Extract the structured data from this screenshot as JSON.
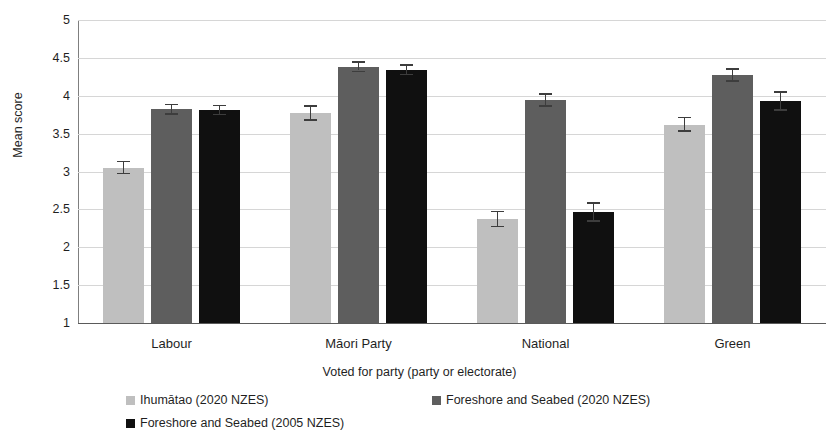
{
  "chart_data": {
    "type": "bar",
    "title": "",
    "xlabel": "Voted for party (party or electorate)",
    "ylabel": "Mean score",
    "ylim": [
      1,
      5
    ],
    "ytick_step": 0.5,
    "yticks": [
      "5",
      "4.5",
      "4",
      "3.5",
      "3",
      "2.5",
      "2",
      "1.5",
      "1"
    ],
    "ytick_values": [
      5,
      4.5,
      4,
      3.5,
      3,
      2.5,
      2,
      1.5,
      1
    ],
    "grid": true,
    "legend_position": "bottom",
    "error_bars": "standard error",
    "categories": [
      "Labour",
      "Māori Party",
      "National",
      "Green"
    ],
    "series": [
      {
        "name": "Ihumātao (2020 NZES)",
        "color": "#bfbfbf",
        "values": [
          3.05,
          3.77,
          2.37,
          3.62
        ],
        "errors": [
          0.08,
          0.09,
          0.1,
          0.09
        ]
      },
      {
        "name": "Foreshore and Seabed (2020 NZES)",
        "color": "#5e5e5e",
        "values": [
          3.82,
          4.38,
          3.94,
          4.27
        ],
        "errors": [
          0.06,
          0.06,
          0.08,
          0.08
        ]
      },
      {
        "name": "Foreshore and Seabed (2005 NZES)",
        "color": "#101010",
        "values": [
          3.81,
          4.34,
          2.46,
          3.93
        ],
        "errors": [
          0.06,
          0.06,
          0.12,
          0.12
        ]
      }
    ]
  },
  "legend": {
    "items": [
      {
        "label": "Ihumātao (2020 NZES)",
        "color": "#bfbfbf"
      },
      {
        "label": "Foreshore and Seabed (2020 NZES)",
        "color": "#5e5e5e"
      },
      {
        "label": "Foreshore and Seabed (2005 NZES)",
        "color": "#101010"
      }
    ]
  }
}
